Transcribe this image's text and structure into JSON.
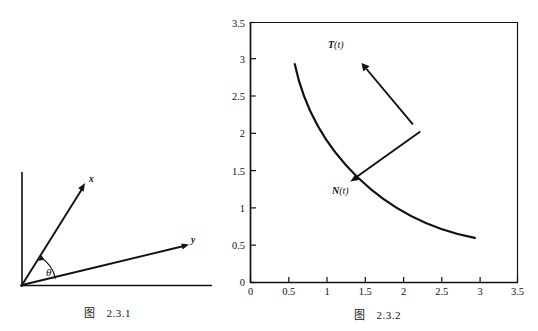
{
  "figures": [
    {
      "id": "fig-2-3-1",
      "caption_prefix": "图",
      "caption_number": "2.3.1",
      "axes": {
        "origin": [
          22,
          285
        ],
        "vertical_top": 172,
        "horizontal_right": 212,
        "color": "#111111"
      },
      "vectors": [
        {
          "name": "x-vector",
          "label": "x",
          "from": [
            22,
            285
          ],
          "to": [
            85,
            184
          ],
          "label_pos": [
            90,
            180
          ]
        },
        {
          "name": "y-vector",
          "label": "y",
          "from": [
            22,
            285
          ],
          "to": [
            188,
            245
          ],
          "label_pos": [
            192,
            241
          ]
        }
      ],
      "angle": {
        "name": "theta-angle",
        "label": "θ",
        "label_pos": [
          47,
          274
        ],
        "arc_radius": 34
      }
    },
    {
      "id": "fig-2-3-2",
      "caption_prefix": "图",
      "caption_number": "2.3.2",
      "chart_data": {
        "type": "line",
        "title": "",
        "xlabel": "",
        "ylabel": "",
        "xlim": [
          0,
          3.5
        ],
        "ylim": [
          0,
          3.5
        ],
        "grid": false,
        "legend": "none",
        "xticks": [
          "0",
          "0.5",
          "1",
          "1.5",
          "2",
          "2.5",
          "3",
          "3.5"
        ],
        "xtick_values": [
          0,
          0.5,
          1,
          1.5,
          2,
          2.5,
          3,
          3.5
        ],
        "yticks": [
          "0",
          "0.5",
          "1",
          "1.5",
          "2",
          "2.5",
          "3",
          "3.5"
        ],
        "ytick_values": [
          0,
          0.5,
          1,
          1.5,
          2,
          2.5,
          3,
          3.5
        ],
        "series": [
          {
            "name": "trajectory-curve",
            "description": "circular arc of radius 3 centred at origin",
            "x": [
              0.58,
              0.8,
              1.05,
              1.3,
              1.55,
              1.8,
              2.05,
              2.12,
              2.3,
              2.5,
              2.7,
              2.85,
              2.94
            ],
            "y": [
              2.94,
              2.89,
              2.81,
              2.7,
              2.57,
              2.4,
              2.19,
              2.12,
              1.93,
              1.66,
              1.31,
              0.93,
              0.6
            ]
          }
        ],
        "annotations": [
          {
            "name": "tangent-vector",
            "label": "T(t)",
            "label_bold": "T",
            "label_rest": "(t)",
            "tail": [
              2.12,
              2.12
            ],
            "head": [
              1.45,
              2.87
            ],
            "label_pos": [
              1.37,
              2.97
            ]
          },
          {
            "name": "normal-vector",
            "label": "N(t)",
            "label_bold": "N",
            "label_rest": "(t)",
            "tail": [
              2.22,
              2.02
            ],
            "head": [
              1.38,
              1.42
            ],
            "label_pos": [
              1.3,
              1.25
            ]
          }
        ],
        "touch_point": [
          2.12,
          2.12
        ]
      }
    }
  ]
}
